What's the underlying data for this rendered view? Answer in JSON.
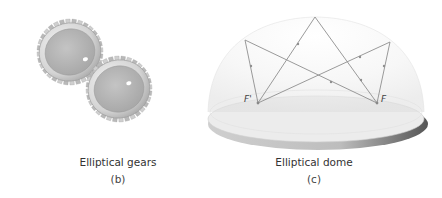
{
  "panels": [
    {
      "id": "b",
      "caption": "Elliptical gears",
      "label": "(b)"
    },
    {
      "id": "c",
      "caption": "Elliptical dome",
      "label": "(c)",
      "foci": [
        {
          "name": "F'",
          "label": "F'"
        },
        {
          "name": "F",
          "label": "F"
        }
      ]
    }
  ],
  "colors": {
    "gear_metal": "#d9d9d9",
    "gear_disk": "#b4b4b4",
    "dome_fill": "#eeeeee",
    "rays": "#8a8a8a",
    "text": "#333333"
  }
}
